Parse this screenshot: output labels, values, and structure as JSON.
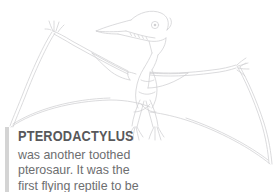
{
  "page": {
    "background_color": "#ffffff",
    "width": 277,
    "height": 192
  },
  "illustration": {
    "name": "pterodactyl-line-drawing",
    "subject": "Pterodactylus",
    "style": "light gray pencil line art",
    "stroke_color": "#cfcfd1",
    "description": "Pterodactylus standing with wings outstretched across the full width, long toothed beak, rear head crest, membranous wings curving down to the lower corners, two clawed feet"
  },
  "text_block": {
    "accent_bar_color": "#d4d4d4",
    "title": "PTERODACTYLUS",
    "title_color": "#58585a",
    "body_color": "#6d6e70",
    "body_lines": [
      "was another toothed",
      "pterosaur. It was the",
      "first flying reptile to be"
    ]
  }
}
